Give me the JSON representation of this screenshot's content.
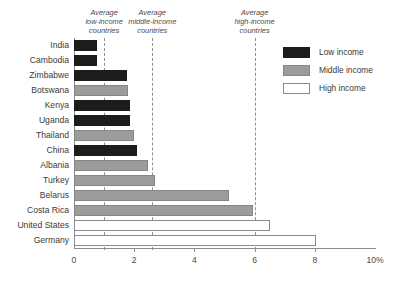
{
  "chart_data": {
    "type": "bar",
    "orientation": "horizontal",
    "title": "",
    "subtitle": "",
    "xlabel": "",
    "ylabel": "",
    "xlim": [
      0,
      10
    ],
    "ylim": null,
    "grid": false,
    "x_unit": "%",
    "x_ticks": [
      {
        "value": 0,
        "label": "0"
      },
      {
        "value": 2,
        "label": "2"
      },
      {
        "value": 4,
        "label": "4"
      },
      {
        "value": 6,
        "label": "6"
      },
      {
        "value": 8,
        "label": "8"
      },
      {
        "value": 10,
        "label": "10%"
      }
    ],
    "categories": [
      "India",
      "Cambodia",
      "Zimbabwe",
      "Botswana",
      "Kenya",
      "Uganda",
      "Thailand",
      "China",
      "Albania",
      "Turkey",
      "Belarus",
      "Costa Rica",
      "United States",
      "Germany"
    ],
    "values": [
      0.75,
      0.75,
      1.75,
      1.8,
      1.85,
      1.85,
      2.0,
      2.1,
      2.45,
      2.7,
      5.15,
      5.95,
      6.5,
      8.05
    ],
    "groups": [
      "low",
      "low",
      "low",
      "middle",
      "low",
      "low",
      "middle",
      "low",
      "middle",
      "middle",
      "middle",
      "middle",
      "high",
      "high"
    ],
    "bars": [
      {
        "category": "India",
        "value": 0.75,
        "group": "low"
      },
      {
        "category": "Cambodia",
        "value": 0.75,
        "group": "low"
      },
      {
        "category": "Zimbabwe",
        "value": 1.75,
        "group": "low"
      },
      {
        "category": "Botswana",
        "value": 1.8,
        "group": "middle"
      },
      {
        "category": "Kenya",
        "value": 1.85,
        "group": "low"
      },
      {
        "category": "Uganda",
        "value": 1.85,
        "group": "low"
      },
      {
        "category": "Thailand",
        "value": 2.0,
        "group": "middle"
      },
      {
        "category": "China",
        "value": 2.1,
        "group": "low"
      },
      {
        "category": "Albania",
        "value": 2.45,
        "group": "middle"
      },
      {
        "category": "Turkey",
        "value": 2.7,
        "group": "middle"
      },
      {
        "category": "Belarus",
        "value": 5.15,
        "group": "middle"
      },
      {
        "category": "Costa Rica",
        "value": 5.95,
        "group": "middle"
      },
      {
        "category": "United States",
        "value": 6.5,
        "group": "high"
      },
      {
        "category": "Germany",
        "value": 8.05,
        "group": "high"
      }
    ],
    "legend": {
      "position": "top-right",
      "entries": [
        {
          "key": "low",
          "label": "Low income",
          "color": "#1c1c1c"
        },
        {
          "key": "middle",
          "label": "Middle income",
          "color": "#9c9c9c"
        },
        {
          "key": "high",
          "label": "High income",
          "color": "#ffffff"
        }
      ]
    },
    "reference_lines": [
      {
        "value": 1.0,
        "label_lines": [
          "Average",
          "low-income",
          "countries"
        ],
        "style": "dashed"
      },
      {
        "value": 2.6,
        "label_lines": [
          "Average",
          "middle-income",
          "countries"
        ],
        "style": "dashed"
      },
      {
        "value": 6.0,
        "label_lines": [
          "Average",
          "high-income",
          "countries"
        ],
        "style": "dashed"
      }
    ],
    "annotations": [
      "Average low-income countries",
      "Average middle-income countries",
      "Average high-income countries"
    ],
    "colors": {
      "low_income": "#1c1c1c",
      "middle_income": "#9c9c9c",
      "high_income": "#ffffff",
      "axis": "#8c8c8c",
      "reference_line": "#8f8f8f",
      "text": "#3a3a3a"
    }
  }
}
